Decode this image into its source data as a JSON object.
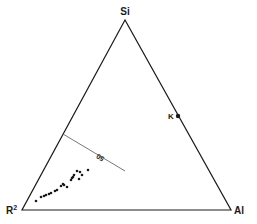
{
  "diagram": {
    "type": "ternary",
    "vertices": {
      "top": {
        "label": "Si",
        "x": 125,
        "y": 20
      },
      "bottom_left": {
        "label": "R",
        "superscript": "2",
        "x": 22,
        "y": 210
      },
      "bottom_right": {
        "label": "Al",
        "x": 231,
        "y": 210
      }
    },
    "tie_line": {
      "x1": 63,
      "y1": 134,
      "x2": 125,
      "y2": 171,
      "label": "50"
    },
    "marked_point": {
      "label": "K",
      "x": 178,
      "y": 116
    },
    "points": [
      [
        36,
        201
      ],
      [
        41,
        197
      ],
      [
        44,
        196
      ],
      [
        46,
        195
      ],
      [
        49,
        194
      ],
      [
        51,
        193
      ],
      [
        55,
        191
      ],
      [
        57,
        190
      ],
      [
        61,
        186
      ],
      [
        63,
        184
      ],
      [
        64,
        185
      ],
      [
        67,
        187
      ],
      [
        71,
        180
      ],
      [
        72,
        178
      ],
      [
        73,
        177
      ],
      [
        74,
        175
      ],
      [
        77,
        171
      ],
      [
        79,
        179
      ],
      [
        80,
        172
      ],
      [
        82,
        175
      ],
      [
        88,
        170
      ]
    ],
    "colors": {
      "stroke": "#1a1a1a",
      "tie_line": "#555555",
      "background": "#ffffff"
    }
  }
}
